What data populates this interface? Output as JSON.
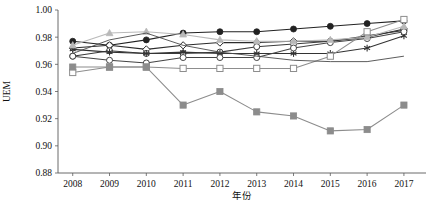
{
  "chart_data": {
    "type": "line",
    "title": "",
    "xlabel": "年份",
    "ylabel": "UEM",
    "xlim": [
      2007.6,
      2017.6
    ],
    "ylim": [
      0.88,
      1.0
    ],
    "grid": false,
    "legend": "none",
    "x": [
      2008,
      2009,
      2010,
      2011,
      2012,
      2013,
      2014,
      2015,
      2016,
      2017
    ],
    "xtick_labels": [
      "2008",
      "2009",
      "2010",
      "2011",
      "2012",
      "2013",
      "2014",
      "2015",
      "2016",
      "2017"
    ],
    "ytick_labels": [
      "0.88",
      "0.90",
      "0.92",
      "0.94",
      "0.96",
      "0.98",
      "1.00"
    ],
    "ytick_values": [
      0.88,
      0.9,
      0.92,
      0.94,
      0.96,
      0.98,
      1.0
    ],
    "series": [
      {
        "name": "series-black-circle",
        "marker": "filled-circle",
        "color": "#222222",
        "values": [
          0.977,
          0.974,
          0.978,
          0.983,
          0.984,
          0.984,
          0.986,
          0.988,
          0.99,
          0.992
        ]
      },
      {
        "name": "series-open-diamond",
        "marker": "open-diamond",
        "color": "#2b2b2b",
        "values": [
          0.972,
          0.974,
          0.971,
          0.974,
          0.976,
          0.976,
          0.977,
          0.977,
          0.98,
          0.986
        ]
      },
      {
        "name": "series-open-circle-upper",
        "marker": "open-circle",
        "color": "#3a3a3a",
        "values": [
          0.966,
          0.97,
          0.968,
          0.968,
          0.969,
          0.973,
          0.975,
          0.977,
          0.981,
          0.985
        ]
      },
      {
        "name": "series-asterisk",
        "marker": "asterisk",
        "color": "#333333",
        "values": [
          0.971,
          0.969,
          0.968,
          0.969,
          0.968,
          0.968,
          0.968,
          0.968,
          0.972,
          0.981
        ]
      },
      {
        "name": "series-open-circle-lower",
        "marker": "open-circle",
        "color": "#444444",
        "values": [
          0.966,
          0.963,
          0.961,
          0.965,
          0.965,
          0.965,
          0.972,
          0.976,
          0.979,
          0.984
        ]
      },
      {
        "name": "series-light-triangle",
        "marker": "filled-triangle",
        "color": "#b9b9b9",
        "values": [
          0.974,
          0.983,
          0.984,
          0.982,
          0.978,
          0.977,
          0.977,
          0.978,
          0.98,
          0.988
        ]
      },
      {
        "name": "series-open-square",
        "marker": "open-square",
        "color": "#8d8d8d",
        "values": [
          0.954,
          0.958,
          0.958,
          0.957,
          0.957,
          0.957,
          0.957,
          0.966,
          0.984,
          0.993
        ]
      },
      {
        "name": "series-gray-square",
        "marker": "filled-square",
        "color": "#8c8c8c",
        "values": [
          0.958,
          0.958,
          0.958,
          0.93,
          0.94,
          0.925,
          0.922,
          0.911,
          0.912,
          0.93
        ]
      },
      {
        "name": "series-plain-line",
        "marker": "none",
        "color": "#4a4a4a",
        "values": [
          0.968,
          0.978,
          0.983,
          0.974,
          0.969,
          0.966,
          0.963,
          0.962,
          0.962,
          0.966
        ]
      }
    ]
  }
}
